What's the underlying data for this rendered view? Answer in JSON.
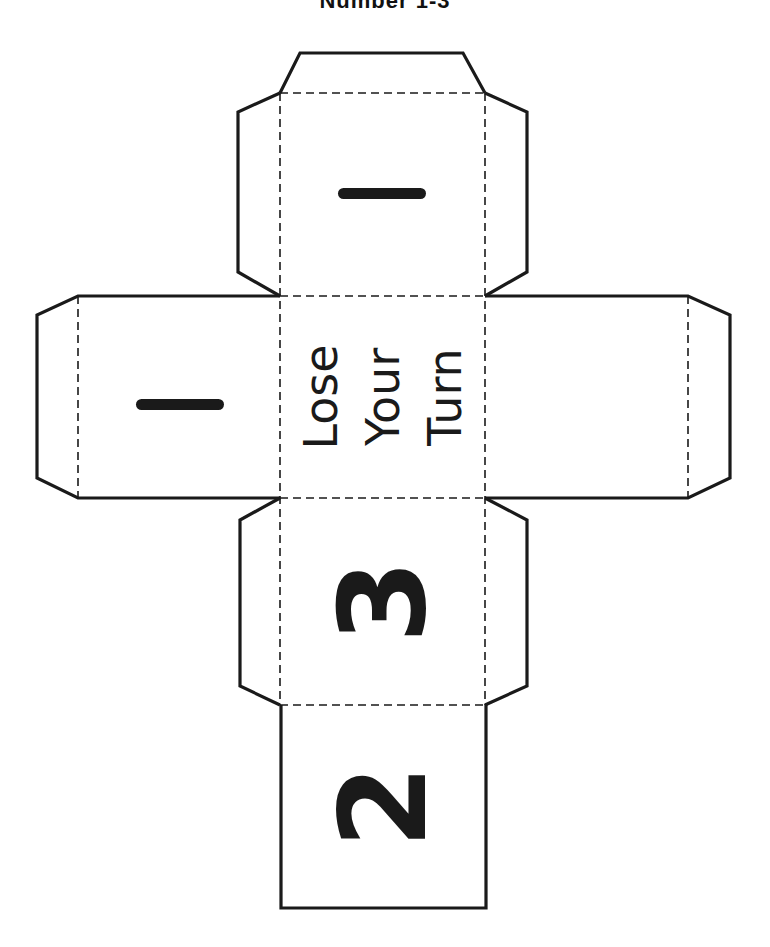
{
  "header": {
    "title": "Number 1-3"
  },
  "die_net": {
    "stroke_color": "#1a1a1a",
    "background": "#ffffff",
    "faces": {
      "top": {
        "label": "1",
        "style": "bar"
      },
      "left": {
        "label": "1",
        "style": "bar"
      },
      "center": {
        "lines": [
          "Lose",
          "Your",
          "Turn"
        ]
      },
      "right": {
        "label": ""
      },
      "middle_lower": {
        "label": "3"
      },
      "bottom": {
        "label": "2"
      }
    }
  }
}
